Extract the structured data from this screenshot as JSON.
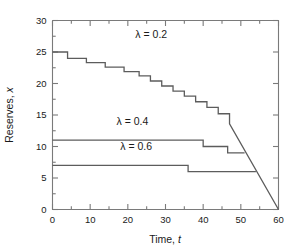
{
  "chart_data": {
    "type": "line",
    "title": "",
    "xlabel": "Time, t",
    "ylabel": "Reserves, x",
    "xlim": [
      0,
      60
    ],
    "ylim": [
      0,
      30
    ],
    "x_major_ticks": [
      0,
      10,
      20,
      30,
      40,
      50,
      60
    ],
    "x_major_tick_labels": [
      "0",
      "10",
      "20",
      "30",
      "40",
      "50",
      "60"
    ],
    "x_minor_ticks": [
      5,
      15,
      25,
      35,
      45,
      55
    ],
    "y_major_ticks": [
      0,
      5,
      10,
      15,
      20,
      25,
      30
    ],
    "y_major_tick_labels": [
      "0",
      "5",
      "10",
      "15",
      "20",
      "25",
      "30"
    ],
    "y_minor_ticks": [
      2.5,
      7.5,
      12.5,
      17.5,
      22.5,
      27.5
    ],
    "grid": false,
    "legend_position": "inline-annotations",
    "series": [
      {
        "name": "lambda = 0.2",
        "label": "λ = 0.2",
        "label_x": 22,
        "label_y": 27.2,
        "points": [
          [
            0,
            25
          ],
          [
            4,
            25
          ],
          [
            4,
            24
          ],
          [
            9,
            24
          ],
          [
            9,
            23.3
          ],
          [
            14,
            23.3
          ],
          [
            14,
            22.6
          ],
          [
            19,
            22.6
          ],
          [
            19,
            21.9
          ],
          [
            23,
            21.9
          ],
          [
            23,
            21.2
          ],
          [
            26,
            21.2
          ],
          [
            26,
            20.4
          ],
          [
            29,
            20.4
          ],
          [
            29,
            19.6
          ],
          [
            32,
            19.6
          ],
          [
            32,
            18.8
          ],
          [
            35,
            18.8
          ],
          [
            35,
            18.0
          ],
          [
            38,
            18.0
          ],
          [
            38,
            17.1
          ],
          [
            41,
            17.1
          ],
          [
            41,
            16.2
          ],
          [
            44,
            16.2
          ],
          [
            44,
            15.2
          ],
          [
            47,
            15.2
          ],
          [
            47,
            13.6
          ],
          [
            60,
            0
          ]
        ]
      },
      {
        "name": "lambda = 0.4",
        "label": "λ = 0.4",
        "label_x": 17,
        "label_y": 13.4,
        "points": [
          [
            0,
            11
          ],
          [
            40,
            11
          ],
          [
            40,
            10
          ],
          [
            46.5,
            10
          ],
          [
            46.5,
            9
          ],
          [
            51,
            9
          ]
        ]
      },
      {
        "name": "lambda = 0.6",
        "label": "λ = 0.6",
        "label_x": 18,
        "label_y": 9.5,
        "points": [
          [
            0,
            7
          ],
          [
            36,
            7
          ],
          [
            36,
            6
          ],
          [
            54,
            6
          ]
        ]
      }
    ],
    "colors": {
      "curve": "#5c5c5c",
      "axis": "#7a7a7a",
      "text": "#1a1a1a",
      "background": "#ffffff"
    }
  },
  "axes": {
    "xlabel_prefix": "Time, ",
    "xlabel_variable": "t",
    "ylabel_prefix": "Reserves, ",
    "ylabel_variable": "x"
  }
}
